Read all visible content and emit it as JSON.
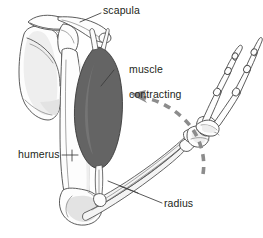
{
  "figure": {
    "background_color": "#ffffff",
    "width": 263,
    "height": 238
  },
  "colors": {
    "muscle_fill": "#646464",
    "bone_outline": "#4a4a4a",
    "bone_fill": "#fdfdfd",
    "bone_shading": "#e3e3e3",
    "label_text": "#231f20",
    "motion_arrow": "#8c8c8c",
    "leader_line": "#3b3b3b"
  },
  "labels": {
    "scapula": {
      "text": "scapula",
      "x": 103,
      "y": 6
    },
    "muscle_contracting": {
      "line1": "muscle",
      "line2": "contracting",
      "x": 117,
      "y": 52
    },
    "humerus": {
      "text": "humerus",
      "x": 18,
      "y": 148
    },
    "radius": {
      "text": "radius",
      "x": 164,
      "y": 199
    }
  },
  "anatomy": {
    "parts": [
      "scapula",
      "clavicle",
      "humerus",
      "radius",
      "ulna",
      "carpals",
      "metacarpals",
      "phalanges",
      "biceps-muscle",
      "tendon"
    ]
  },
  "annotations": {
    "motion_arrow": {
      "name": "curved-dashed-motion-arrow",
      "direction": "upward-left",
      "style": "dashed",
      "color": "#8c8c8c",
      "meaning": "forearm flexion"
    }
  }
}
